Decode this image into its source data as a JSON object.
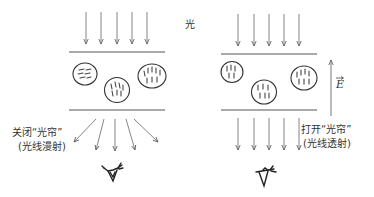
{
  "diagram": {
    "light_label": "光",
    "left_panel": {
      "state_label_line1": "关闭“光帘”",
      "state_label_line2": "(光线漫射)",
      "description": "liquid crystal droplets randomly oriented; light scattered"
    },
    "right_panel": {
      "state_label_line1": "打开“光帘”",
      "state_label_line2": "(光线透射)",
      "field_label": "E",
      "description": "electric field aligns droplets; light transmitted"
    },
    "colors": {
      "line": "#555555",
      "arrow": "#666666",
      "text": "#333333",
      "background": "#ffffff"
    }
  }
}
